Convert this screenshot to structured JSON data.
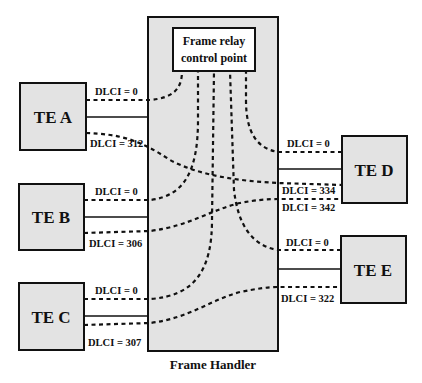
{
  "diagram": {
    "caption": "Frame Handler",
    "control_point": {
      "line1": "Frame relay",
      "line2": "control point"
    },
    "colors": {
      "box_fill": "#e3e3e3",
      "stroke": "#111111",
      "control_fill": "#ffffff",
      "background": "#ffffff"
    },
    "terminals": [
      {
        "id": "A",
        "label": "TE A",
        "dlci_control": "DLCI = 0",
        "dlci_data": "DLCI = 312"
      },
      {
        "id": "B",
        "label": "TE B",
        "dlci_control": "DLCI = 0",
        "dlci_data": "DLCI = 306"
      },
      {
        "id": "C",
        "label": "TE C",
        "dlci_control": "DLCI = 0",
        "dlci_data": "DLCI = 307"
      },
      {
        "id": "D",
        "label": "TE D",
        "dlci_control": "DLCI = 0",
        "dlci_data": [
          "DLCI = 334",
          "DLCI = 342"
        ]
      },
      {
        "id": "E",
        "label": "TE E",
        "dlci_control": "DLCI = 0",
        "dlci_data": "DLCI = 322"
      }
    ],
    "connections": [
      {
        "from": "TE A",
        "from_dlci": "DLCI = 312",
        "to": "TE D",
        "to_dlci": "DLCI = 334"
      },
      {
        "from": "TE B",
        "from_dlci": "DLCI = 306",
        "to": "TE D",
        "to_dlci": "DLCI = 342"
      },
      {
        "from": "TE C",
        "from_dlci": "DLCI = 307",
        "to": "TE E",
        "to_dlci": "DLCI = 322"
      },
      {
        "from": "TE A",
        "from_dlci": "DLCI = 0",
        "to": "Frame relay control point"
      },
      {
        "from": "TE B",
        "from_dlci": "DLCI = 0",
        "to": "Frame relay control point"
      },
      {
        "from": "TE C",
        "from_dlci": "DLCI = 0",
        "to": "Frame relay control point"
      },
      {
        "from": "TE D",
        "from_dlci": "DLCI = 0",
        "to": "Frame relay control point"
      },
      {
        "from": "TE E",
        "from_dlci": "DLCI = 0",
        "to": "Frame relay control point"
      }
    ]
  }
}
